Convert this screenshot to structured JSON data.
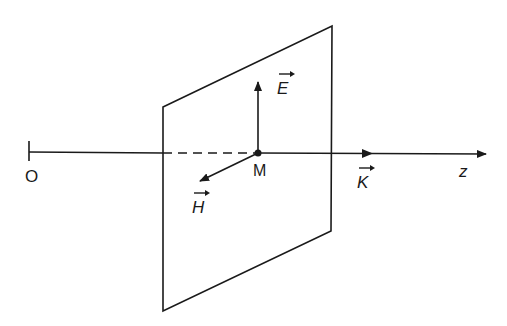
{
  "diagram": {
    "type": "plane electromagnetic wave geometry",
    "stroke_color": "#1a1a1a",
    "labels": {
      "origin": "O",
      "point": "M",
      "axis": "z",
      "e_field": "E",
      "h_field": "H",
      "wave_vector": "K"
    },
    "elements": {
      "axis": {
        "from": [
          29,
          153
        ],
        "to": [
          487,
          154
        ],
        "hidden_segment": [
          163,
          258
        ],
        "hidden_style": "dashed"
      },
      "plane": {
        "corners": [
          [
            163,
            107
          ],
          [
            332,
            26
          ],
          [
            331,
            231
          ],
          [
            163,
            311
          ]
        ]
      },
      "vectors": [
        {
          "name": "E",
          "from": [
            258,
            153
          ],
          "to": [
            258,
            82
          ]
        },
        {
          "name": "H",
          "from": [
            258,
            153
          ],
          "to": [
            200,
            181
          ]
        },
        {
          "name": "K",
          "position": [
            373,
            153
          ],
          "direction": "+z"
        }
      ]
    }
  }
}
